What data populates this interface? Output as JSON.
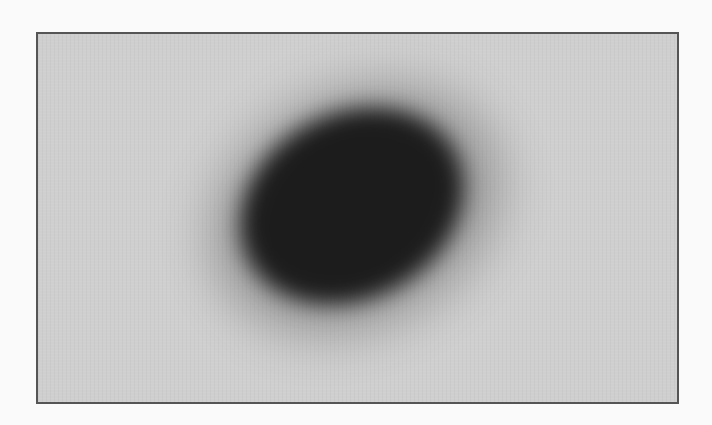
{
  "image": {
    "description": "Blurred dark tilted ellipse on light gray bordered canvas",
    "canvas": {
      "background_color": "#cfcfcf",
      "border_color": "#555555"
    },
    "blob": {
      "color": "#1c1c1c",
      "rotation_deg": -28
    }
  }
}
